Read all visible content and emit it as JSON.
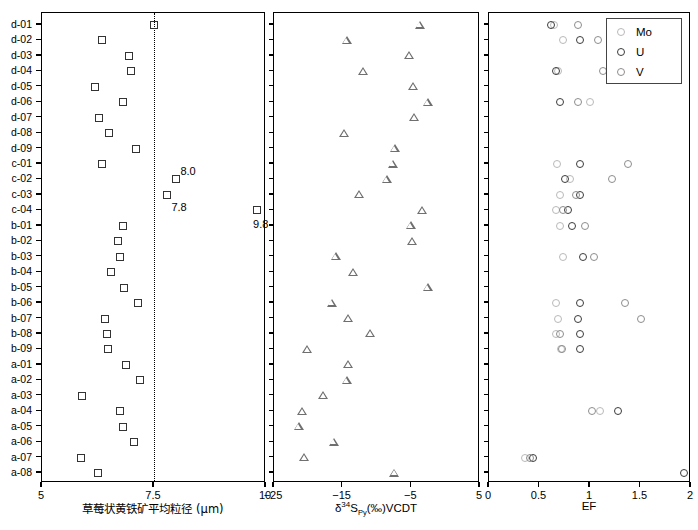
{
  "figure": {
    "background_color": "#ffffff",
    "width": 698,
    "height": 530
  },
  "rows": [
    "d-01",
    "d-02",
    "d-03",
    "d-04",
    "d-05",
    "d-06",
    "d-07",
    "d-08",
    "d-09",
    "c-01",
    "c-02",
    "c-03",
    "c-04",
    "b-01",
    "b-02",
    "b-03",
    "b-04",
    "b-05",
    "b-06",
    "b-07",
    "b-08",
    "b-09",
    "a-01",
    "a-02",
    "a-03",
    "a-04",
    "a-05",
    "a-06",
    "a-07",
    "a-08"
  ],
  "legend": {
    "position": "top-right-panel3",
    "entries": [
      {
        "label": "Mo",
        "marker": "open-circle",
        "color": "#b9b9b9"
      },
      {
        "label": "U",
        "marker": "open-circle",
        "color": "#3b3b3b"
      },
      {
        "label": "V",
        "marker": "open-circle",
        "color": "#8d8d8d"
      }
    ]
  },
  "annotations": [
    {
      "text": "8.0",
      "panel": 1,
      "row": "c-02"
    },
    {
      "text": "7.8",
      "panel": 1,
      "row": "c-03"
    },
    {
      "text": "9.8",
      "panel": 1,
      "row": "c-04"
    }
  ],
  "chart_data": [
    {
      "type": "scatter",
      "panel": 1,
      "title": "",
      "xlabel": "草莓状黄铁矿平均粒径 (μm)",
      "ylabel": "",
      "xlim": [
        5,
        10
      ],
      "xticks": [
        5,
        7.5,
        10
      ],
      "xticklabels": [
        "5",
        "7.5",
        "10"
      ],
      "grid": false,
      "reference_line": {
        "x": 7.5,
        "style": "dotted"
      },
      "marker": "open-square",
      "categories": [
        "d-01",
        "d-02",
        "d-03",
        "d-04",
        "d-05",
        "d-06",
        "d-07",
        "d-08",
        "d-09",
        "c-01",
        "c-02",
        "c-03",
        "c-04",
        "b-01",
        "b-02",
        "b-03",
        "b-04",
        "b-05",
        "b-06",
        "b-07",
        "b-08",
        "b-09",
        "a-01",
        "a-02",
        "a-03",
        "a-04",
        "a-05",
        "a-06",
        "a-07",
        "a-08"
      ],
      "values": [
        7.5,
        6.34,
        6.94,
        6.99,
        6.18,
        6.8,
        6.28,
        6.5,
        7.09,
        6.35,
        8.0,
        7.8,
        9.8,
        6.8,
        6.7,
        6.75,
        6.53,
        6.82,
        7.14,
        6.4,
        6.45,
        6.47,
        6.88,
        7.19,
        5.89,
        6.73,
        6.8,
        7.05,
        5.88,
        6.26
      ]
    },
    {
      "type": "scatter",
      "panel": 2,
      "title": "",
      "xlabel": "δ34SPy(‰)VCDT",
      "xlabel_parts": {
        "delta": "δ",
        "superscript": "34",
        "element": "S",
        "subscript": "Py",
        "suffix": "(‰)VCDT"
      },
      "ylabel": "",
      "xlim": [
        -25,
        5
      ],
      "xticks": [
        -25,
        -15,
        -5,
        5
      ],
      "xticklabels": [
        "-25",
        "-15",
        "-5",
        "5"
      ],
      "grid": false,
      "marker": "open-triangle",
      "categories": [
        "d-01",
        "d-02",
        "d-03",
        "d-04",
        "d-05",
        "d-06",
        "d-07",
        "d-08",
        "d-09",
        "c-01",
        "c-02",
        "c-03",
        "c-04",
        "b-01",
        "b-02",
        "b-03",
        "b-04",
        "b-05",
        "b-06",
        "b-07",
        "b-08",
        "b-09",
        "a-01",
        "a-02",
        "a-03",
        "a-04",
        "a-05",
        "a-06",
        "a-07",
        "a-08"
      ],
      "values": [
        -3.8,
        -14.4,
        -5.3,
        -12.0,
        -4.7,
        -2.6,
        -4.6,
        -14.8,
        -7.4,
        -7.7,
        -8.6,
        -12.6,
        -3.4,
        -5.1,
        -4.9,
        -16.0,
        -13.5,
        -2.6,
        -16.6,
        -14.2,
        -11.0,
        -20.2,
        -14.2,
        -14.4,
        -17.8,
        -20.9,
        -21.4,
        -16.3,
        -20.6,
        -7.5
      ]
    },
    {
      "type": "scatter",
      "panel": 3,
      "title": "",
      "xlabel": "EF",
      "ylabel": "",
      "xlim": [
        0,
        2
      ],
      "xticks": [
        0,
        0.5,
        1,
        1.5,
        2
      ],
      "xticklabels": [
        "0",
        "0.5",
        "1",
        "1.5",
        "2"
      ],
      "grid": false,
      "series": [
        {
          "name": "Mo",
          "marker": "open-circle",
          "color": "#b9b9b9",
          "values": [
            0.64,
            0.73,
            null,
            0.68,
            null,
            1.0,
            null,
            null,
            null,
            0.67,
            0.8,
            0.7,
            0.66,
            0.7,
            null,
            0.73,
            null,
            null,
            0.66,
            0.68,
            0.66,
            0.71,
            null,
            null,
            null,
            1.1,
            null,
            null,
            0.36,
            null
          ]
        },
        {
          "name": "U",
          "marker": "open-circle",
          "color": "#3b3b3b",
          "values": [
            0.61,
            0.9,
            null,
            0.66,
            null,
            0.7,
            null,
            null,
            null,
            0.9,
            0.75,
            0.9,
            0.78,
            0.82,
            null,
            0.93,
            null,
            null,
            0.9,
            0.88,
            0.9,
            0.9,
            null,
            null,
            null,
            1.28,
            null,
            null,
            0.44,
            1.93
          ]
        },
        {
          "name": "V",
          "marker": "open-circle",
          "color": "#8d8d8d",
          "values": [
            0.88,
            1.08,
            null,
            1.13,
            null,
            0.88,
            null,
            null,
            null,
            1.38,
            1.22,
            0.86,
            0.73,
            0.95,
            null,
            1.04,
            null,
            null,
            1.35,
            1.5,
            0.7,
            0.72,
            null,
            null,
            null,
            1.02,
            null,
            null,
            0.41,
            null
          ]
        }
      ]
    }
  ]
}
